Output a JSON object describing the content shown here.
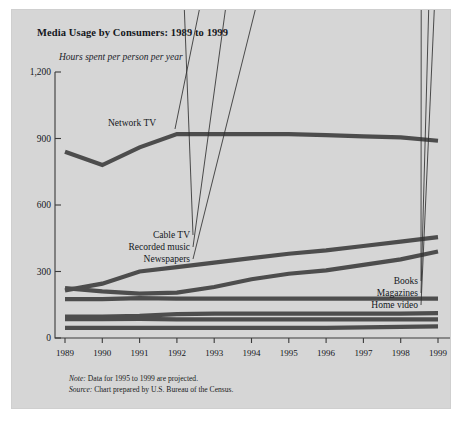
{
  "figure": {
    "title": "Media Usage by Consumers: 1989 to 1999",
    "subtitle": "Hours spent per person per year",
    "note_key": "Note:",
    "note_text": " Data for 1995 to 1999 are projected.",
    "source_key": "Source:",
    "source_text": " Chart prepared by U.S. Bureau of the Census.",
    "background_color": "#d6d6d6",
    "line_color": "#4d4d4d",
    "axis_color": "#3b3b3b"
  },
  "chart_data": {
    "type": "line",
    "title": "Media Usage by Consumers: 1989 to 1999",
    "subtitle": "Hours spent per person per year",
    "xlabel": "",
    "ylabel": "Hours spent per person per year",
    "categories": [
      "1989",
      "1990",
      "1991",
      "1992",
      "1993",
      "1994",
      "1995",
      "1996",
      "1997",
      "1998",
      "1999"
    ],
    "x": [
      1989,
      1990,
      1991,
      1992,
      1993,
      1994,
      1995,
      1996,
      1997,
      1998,
      1999
    ],
    "ylim": [
      0,
      1200
    ],
    "yticks": [
      0,
      300,
      600,
      900,
      1200
    ],
    "ytick_labels": [
      "0",
      "300",
      "600",
      "900",
      "1,200"
    ],
    "grid": false,
    "legend": "inline-labels",
    "series": [
      {
        "name": "Network TV",
        "label_position": "above-line-at-1991",
        "values": [
          840,
          780,
          860,
          920,
          920,
          920,
          920,
          915,
          910,
          905,
          890
        ]
      },
      {
        "name": "Cable TV",
        "label_position": "left-cluster",
        "values": [
          215,
          245,
          300,
          320,
          340,
          360,
          380,
          395,
          415,
          435,
          455
        ]
      },
      {
        "name": "Recorded music",
        "label_position": "left-cluster",
        "values": [
          225,
          210,
          200,
          205,
          230,
          265,
          290,
          305,
          330,
          355,
          390
        ]
      },
      {
        "name": "Newspapers",
        "label_position": "left-cluster",
        "values": [
          175,
          175,
          180,
          178,
          178,
          178,
          178,
          178,
          178,
          178,
          178
        ]
      },
      {
        "name": "Books",
        "label_position": "right-cluster",
        "values": [
          96,
          96,
          100,
          108,
          110,
          110,
          110,
          110,
          110,
          110,
          112
        ]
      },
      {
        "name": "Magazines",
        "label_position": "right-cluster",
        "values": [
          85,
          85,
          86,
          84,
          84,
          84,
          84,
          84,
          84,
          84,
          84
        ]
      },
      {
        "name": "Home video",
        "label_position": "right-cluster",
        "values": [
          46,
          46,
          46,
          46,
          46,
          46,
          46,
          46,
          48,
          50,
          52
        ]
      }
    ]
  }
}
